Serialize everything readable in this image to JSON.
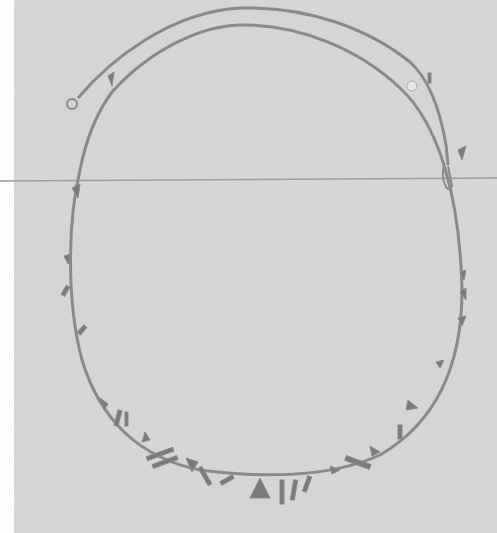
{
  "image": {
    "subject": "silver tube-bead necklace with dangling geometric charms",
    "background_color": "#d6d6d4",
    "strand_color": "#8a8a88",
    "charm_color": "#7a7a78",
    "seam_line_color": "#9a9a98"
  }
}
